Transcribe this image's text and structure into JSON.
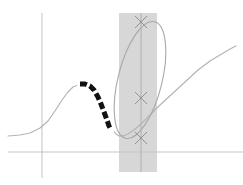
{
  "figure": {
    "title": "",
    "background_color": "#ffffff",
    "width": 243,
    "height": 185
  },
  "colors": {
    "axis": "#c8c8c8",
    "curve_gray": "#b4b4b4",
    "curve_black": "#111111",
    "band_fill": "#c9c9c9",
    "ellipse_stroke": "#a8a8a8",
    "vertical_line": "#b0b0b0",
    "marker": "#909090"
  },
  "chart_data": {
    "type": "line",
    "title": "",
    "subtitle": "",
    "xlabel": "",
    "ylabel": "",
    "grid": false,
    "legend": [],
    "axes": {
      "x_axis_y_px": 152,
      "y_axis_x_px": 42,
      "x_axis_from_px": 8,
      "x_axis_to_px": 243,
      "y_axis_from_px": 13,
      "y_axis_to_px": 178
    },
    "series": [
      {
        "name": "gray-curve",
        "style": "solid",
        "color": "#b4b4b4",
        "points_px": [
          [
            8,
            136
          ],
          [
            20,
            135
          ],
          [
            30,
            133
          ],
          [
            40,
            128
          ],
          [
            48,
            121
          ],
          [
            55,
            111
          ],
          [
            62,
            100
          ],
          [
            68,
            92
          ],
          [
            73,
            87
          ],
          [
            78,
            85
          ],
          [
            83,
            85
          ],
          [
            88,
            87
          ],
          [
            93,
            92
          ],
          [
            98,
            100
          ],
          [
            103,
            110
          ],
          [
            108,
            121
          ],
          [
            112,
            129
          ],
          [
            116,
            134
          ],
          [
            119,
            136
          ],
          [
            123,
            136
          ],
          [
            128,
            134
          ],
          [
            134,
            130
          ],
          [
            141,
            124
          ],
          [
            150,
            115
          ],
          [
            160,
            105
          ],
          [
            172,
            94
          ],
          [
            185,
            82
          ],
          [
            198,
            70
          ],
          [
            210,
            61
          ],
          [
            220,
            55
          ],
          [
            230,
            49
          ],
          [
            236,
            46
          ]
        ]
      },
      {
        "name": "black-dashed-curve",
        "style": "dashed",
        "color": "#111111",
        "dash_pattern": [
          7,
          3
        ],
        "points_px": [
          [
            80,
            84
          ],
          [
            85,
            84
          ],
          [
            90,
            86
          ],
          [
            94,
            90
          ],
          [
            98,
            97
          ],
          [
            101,
            104
          ],
          [
            104,
            112
          ],
          [
            107,
            120
          ],
          [
            109,
            126
          ],
          [
            111,
            130
          ]
        ]
      }
    ],
    "shaded_band": {
      "name": "highlight-band",
      "x_from_px": 119,
      "x_to_px": 157,
      "y_from_px": 13,
      "y_to_px": 172,
      "fill": "#c9c9c9",
      "opacity": 0.75
    },
    "ellipse": {
      "name": "tilted-ellipse",
      "center_px": [
        140,
        80
      ],
      "rx_px": 22,
      "ry_px": 60,
      "rotation_deg": 14,
      "stroke": "#a8a8a8"
    },
    "vertical_marker_line": {
      "x_px": 141,
      "y_from_px": 13,
      "y_to_px": 172,
      "stroke": "#b0b0b0"
    },
    "markers": [
      {
        "label": "upper-intersection",
        "x_px": 141,
        "y_px": 22,
        "glyph": "x"
      },
      {
        "label": "middle-intersection",
        "x_px": 141,
        "y_px": 98,
        "glyph": "x"
      },
      {
        "label": "lower-intersection",
        "x_px": 141,
        "y_px": 138,
        "glyph": "x"
      }
    ]
  }
}
